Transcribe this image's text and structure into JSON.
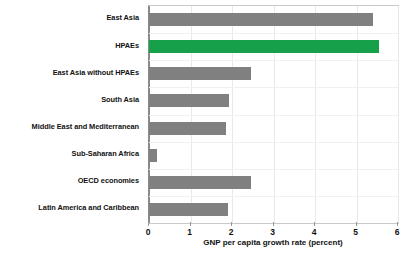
{
  "chart_data": {
    "type": "bar",
    "orientation": "horizontal",
    "title": "",
    "xlabel": "GNP per capita growth rate (percent)",
    "ylabel": "",
    "xlim": [
      0,
      6
    ],
    "xticks": [
      0,
      1,
      2,
      3,
      4,
      5,
      6
    ],
    "xtick_labels": [
      "0",
      "1",
      "2",
      "3",
      "4",
      "5",
      "6"
    ],
    "grid": true,
    "grid_axis": "both",
    "legend": false,
    "categories": [
      "East Asia",
      "HPAEs",
      "East Asia without HPAEs",
      "South Asia",
      "Middle East and Mediterranean",
      "Sub-Saharan Africa",
      "OECD economies",
      "Latin America and Caribbean"
    ],
    "values": [
      5.4,
      5.55,
      2.45,
      1.92,
      1.85,
      0.2,
      2.46,
      1.9
    ],
    "bar_colors": [
      "#808080",
      "#17a04a",
      "#808080",
      "#808080",
      "#808080",
      "#808080",
      "#808080",
      "#808080"
    ],
    "highlight_index": 1,
    "colors": {
      "bar_default": "#808080",
      "bar_highlight": "#17a04a",
      "gridline": "#e9e9e9",
      "axis_line": "#8a8a8a",
      "plot_border": "#c9c9c9",
      "text": "#111111",
      "background": "#ffffff"
    }
  }
}
